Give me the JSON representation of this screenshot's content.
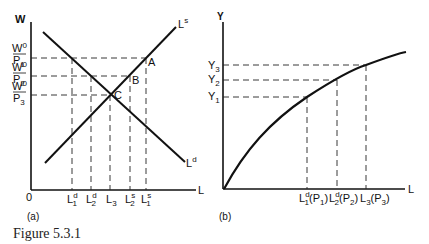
{
  "caption": "Figure 5.3.1",
  "panel_a": {
    "label": "(a)",
    "y_axis": "W",
    "x_axis": "L",
    "origin": "0",
    "supply_curve": {
      "name": "L",
      "sup": "s"
    },
    "demand_curve": {
      "name": "L",
      "sup": "d"
    },
    "points": [
      "A",
      "B",
      "C"
    ],
    "y_ticks": [
      {
        "num": "W",
        "num_sup": "0",
        "den": "P",
        "den_sub": "1"
      },
      {
        "num": "W",
        "num_sup": "0",
        "den": "P",
        "den_sub": "2"
      },
      {
        "num": "W",
        "num_sup": "0",
        "den": "P",
        "den_sub": "3"
      }
    ],
    "x_ticks": [
      {
        "base": "L",
        "sup": "d",
        "sub": "1"
      },
      {
        "base": "L",
        "sup": "d",
        "sub": "2"
      },
      {
        "base": "L",
        "sup": "",
        "sub": "3"
      },
      {
        "base": "L",
        "sup": "s",
        "sub": "2"
      },
      {
        "base": "L",
        "sup": "s",
        "sub": "1"
      }
    ]
  },
  "panel_b": {
    "label": "(b)",
    "y_axis": "Y",
    "x_axis": "L",
    "y_ticks": [
      {
        "base": "Y",
        "sub": "3"
      },
      {
        "base": "Y",
        "sub": "2"
      },
      {
        "base": "Y",
        "sub": "1"
      }
    ],
    "x_ticks": [
      {
        "base": "L",
        "sup": "d",
        "sub": "1",
        "paren": "(P",
        "paren_sub": "1",
        "close": ")"
      },
      {
        "base": "L",
        "sup": "d",
        "sub": "2",
        "paren": "(P",
        "paren_sub": "2",
        "close": ")"
      },
      {
        "base": "L",
        "sup": "",
        "sub": "3",
        "paren": "(P",
        "paren_sub": "3",
        "close": ")"
      }
    ]
  }
}
